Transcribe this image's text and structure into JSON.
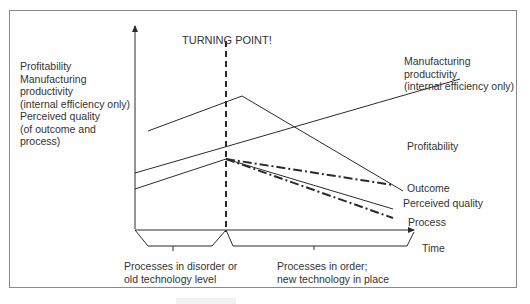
{
  "diagram": {
    "title": "TURNING POINT!",
    "y_axis_label_lines": [
      "Profitability",
      "Manufacturing",
      "productivity",
      "(internal efficiency only)",
      "Perceived quality",
      "(of outcome and",
      "process)"
    ],
    "series_labels": {
      "manufacturing_lines": [
        "Manufacturing",
        "productivity",
        "(internal efficiency only)"
      ],
      "profitability": "Profitability",
      "outcome": "Outcome",
      "perceived_quality": "Perceived quality",
      "process": "Process"
    },
    "x_axis_label": "Time",
    "phases": [
      {
        "lines": [
          "Processes in disorder or",
          "old technology level"
        ]
      },
      {
        "lines": [
          "Processes in order;",
          "new technology in place"
        ]
      }
    ],
    "colors": {
      "line": "#2a2a2a",
      "frame": "#8a8a8a",
      "background": "#ffffff"
    }
  }
}
